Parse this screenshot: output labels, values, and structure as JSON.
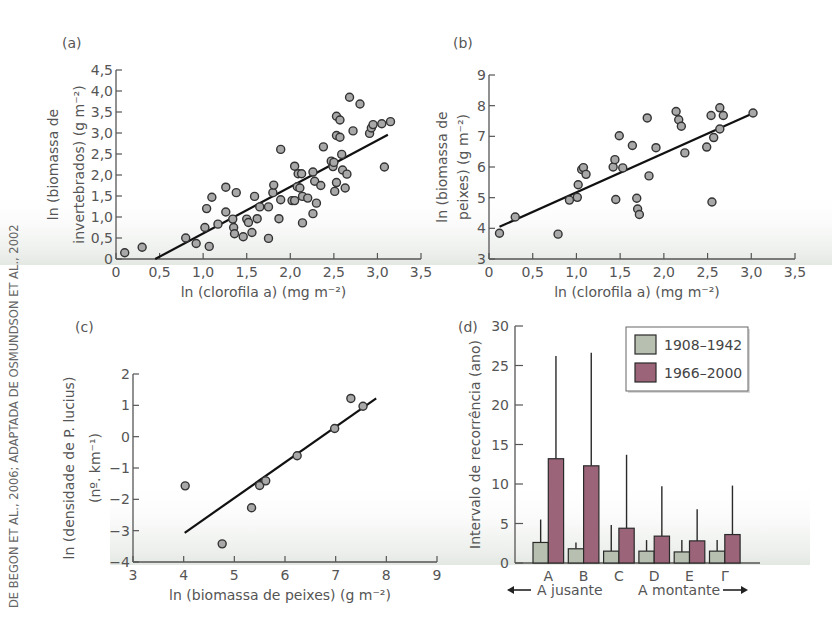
{
  "source_credit": "DE BEGON ET AL., 2006; ADAPTADA DE OSMUNDSON ET AL., 2002",
  "colors": {
    "axis": "#555555",
    "point_fill": "#a8a8a8",
    "point_stroke": "#333333",
    "fit_line": "#111111",
    "series_1908": "#b6bfb0",
    "series_1966": "#9b6479",
    "bar_stroke": "#2a2a2a",
    "bg_shade": "#e9ece8"
  },
  "chart_data": [
    {
      "panel": "(a)",
      "type": "scatter",
      "title": "",
      "xlabel": "ln (clorofila a) (mg m⁻²)",
      "ylabel_line1": "ln (biomassa de",
      "ylabel_line2": "invertebrados) (g m⁻²)",
      "xlim": [
        0,
        3.5
      ],
      "ylim": [
        0,
        4.5
      ],
      "xticks": [
        0,
        0.5,
        1.0,
        1.5,
        2.0,
        2.5,
        3.0,
        3.5
      ],
      "xtick_labels": [
        "0",
        "0,5",
        "1,0",
        "1,5",
        "2,0",
        "2,5",
        "3,0",
        "3,5"
      ],
      "yticks": [
        0,
        0.5,
        1.0,
        1.5,
        2.0,
        2.5,
        3.0,
        3.5,
        4.0,
        4.5
      ],
      "ytick_labels": [
        "0",
        "0,5",
        "1,0",
        "1,5",
        "2,0",
        "2,5",
        "3,0",
        "3,5",
        "4,0",
        "4,5"
      ],
      "fit_line": {
        "x": [
          0.45,
          3.12
        ],
        "y": [
          0.0,
          2.96
        ]
      },
      "points": [
        [
          0.1,
          0.15
        ],
        [
          0.3,
          0.28
        ],
        [
          0.8,
          0.5
        ],
        [
          0.92,
          0.37
        ],
        [
          1.02,
          0.75
        ],
        [
          1.04,
          1.2
        ],
        [
          1.07,
          0.3
        ],
        [
          1.1,
          1.47
        ],
        [
          1.17,
          0.83
        ],
        [
          1.26,
          1.12
        ],
        [
          1.26,
          1.71
        ],
        [
          1.34,
          0.95
        ],
        [
          1.35,
          0.75
        ],
        [
          1.36,
          0.6
        ],
        [
          1.38,
          1.58
        ],
        [
          1.46,
          0.53
        ],
        [
          1.5,
          0.95
        ],
        [
          1.52,
          0.87
        ],
        [
          1.56,
          0.63
        ],
        [
          1.59,
          1.49
        ],
        [
          1.62,
          0.96
        ],
        [
          1.65,
          1.24
        ],
        [
          1.75,
          1.24
        ],
        [
          1.75,
          0.49
        ],
        [
          1.8,
          1.58
        ],
        [
          1.81,
          1.76
        ],
        [
          1.87,
          0.96
        ],
        [
          1.89,
          2.61
        ],
        [
          1.89,
          1.41
        ],
        [
          2.02,
          1.39
        ],
        [
          2.05,
          1.39
        ],
        [
          2.05,
          2.21
        ],
        [
          2.08,
          1.72
        ],
        [
          2.09,
          2.03
        ],
        [
          2.11,
          1.69
        ],
        [
          2.13,
          2.03
        ],
        [
          2.14,
          0.86
        ],
        [
          2.14,
          1.49
        ],
        [
          2.2,
          1.45
        ],
        [
          2.26,
          2.07
        ],
        [
          2.26,
          1.08
        ],
        [
          2.28,
          1.85
        ],
        [
          2.3,
          1.33
        ],
        [
          2.35,
          1.75
        ],
        [
          2.38,
          2.67
        ],
        [
          2.47,
          2.33
        ],
        [
          2.49,
          2.2
        ],
        [
          2.5,
          2.3
        ],
        [
          2.51,
          1.61
        ],
        [
          2.53,
          1.82
        ],
        [
          2.53,
          2.94
        ],
        [
          2.53,
          3.4
        ],
        [
          2.57,
          3.31
        ],
        [
          2.57,
          2.9
        ],
        [
          2.59,
          2.49
        ],
        [
          2.6,
          2.12
        ],
        [
          2.63,
          1.69
        ],
        [
          2.65,
          2.02
        ],
        [
          2.68,
          3.85
        ],
        [
          2.72,
          3.05
        ],
        [
          2.8,
          3.69
        ],
        [
          2.91,
          2.99
        ],
        [
          2.93,
          3.12
        ],
        [
          2.95,
          3.2
        ],
        [
          3.05,
          3.22
        ],
        [
          3.08,
          2.19
        ],
        [
          3.15,
          3.27
        ]
      ]
    },
    {
      "panel": "(b)",
      "type": "scatter",
      "title": "",
      "xlabel": "ln (clorofila a) (mg m⁻²)",
      "ylabel_line1": "ln (biomassa de",
      "ylabel_line2": "peixes) (g m⁻²)",
      "xlim": [
        0,
        3.5
      ],
      "ylim": [
        3,
        9
      ],
      "xticks": [
        0,
        0.5,
        1.0,
        1.5,
        2.0,
        2.5,
        3.0,
        3.5
      ],
      "xtick_labels": [
        "0",
        "0,5",
        "1,0",
        "1,5",
        "2,0",
        "2,5",
        "3,0",
        "3,5"
      ],
      "yticks": [
        3,
        4,
        5,
        6,
        7,
        8,
        9
      ],
      "ytick_labels": [
        "3",
        "4",
        "5",
        "6",
        "7",
        "8",
        "9"
      ],
      "fit_line": {
        "x": [
          0.12,
          3.02
        ],
        "y": [
          4.05,
          7.75
        ]
      },
      "points": [
        [
          0.12,
          3.84
        ],
        [
          0.3,
          4.37
        ],
        [
          0.79,
          3.81
        ],
        [
          0.92,
          4.92
        ],
        [
          1.01,
          5.01
        ],
        [
          1.02,
          5.42
        ],
        [
          1.06,
          5.92
        ],
        [
          1.08,
          5.98
        ],
        [
          1.11,
          5.76
        ],
        [
          1.42,
          6.0
        ],
        [
          1.44,
          6.24
        ],
        [
          1.45,
          4.94
        ],
        [
          1.49,
          7.02
        ],
        [
          1.53,
          5.97
        ],
        [
          1.64,
          6.7
        ],
        [
          1.69,
          4.98
        ],
        [
          1.7,
          4.63
        ],
        [
          1.72,
          4.45
        ],
        [
          1.81,
          7.6
        ],
        [
          1.83,
          5.71
        ],
        [
          1.91,
          6.63
        ],
        [
          2.14,
          7.81
        ],
        [
          2.17,
          7.54
        ],
        [
          2.2,
          7.33
        ],
        [
          2.24,
          6.46
        ],
        [
          2.49,
          6.65
        ],
        [
          2.54,
          7.68
        ],
        [
          2.55,
          4.86
        ],
        [
          2.57,
          6.96
        ],
        [
          2.64,
          7.93
        ],
        [
          2.64,
          7.24
        ],
        [
          2.68,
          7.68
        ],
        [
          3.02,
          7.76
        ]
      ]
    },
    {
      "panel": "(c)",
      "type": "scatter",
      "title": "",
      "xlabel": "ln (biomassa de peixes) (g m⁻²)",
      "ylabel_line1": "ln (densidade de P. lucius)",
      "ylabel_line2": "(nº. km⁻¹)",
      "xlim": [
        3,
        9
      ],
      "ylim": [
        -4,
        2
      ],
      "xticks": [
        3,
        4,
        5,
        6,
        7,
        8,
        9
      ],
      "xtick_labels": [
        "3",
        "4",
        "5",
        "6",
        "7",
        "8",
        "9"
      ],
      "yticks": [
        -4,
        -3,
        -2,
        -1,
        0,
        1,
        2
      ],
      "ytick_labels": [
        "−4",
        "−3",
        "−2",
        "−1",
        "0",
        "1",
        "2"
      ],
      "fit_line": {
        "x": [
          4.02,
          7.8
        ],
        "y": [
          -3.07,
          1.22
        ]
      },
      "points": [
        [
          4.03,
          -1.57
        ],
        [
          4.76,
          -3.42
        ],
        [
          5.34,
          -2.27
        ],
        [
          5.5,
          -1.56
        ],
        [
          5.62,
          -1.41
        ],
        [
          6.24,
          -0.61
        ],
        [
          6.98,
          0.26
        ],
        [
          7.3,
          1.22
        ],
        [
          7.54,
          0.97
        ]
      ]
    },
    {
      "panel": "(d)",
      "type": "bar",
      "title": "",
      "xlabel": "",
      "ylabel": "Intervalo de recorrência (ano)",
      "ylim": [
        0,
        30
      ],
      "yticks": [
        0,
        5,
        10,
        15,
        20,
        25,
        30
      ],
      "ytick_labels": [
        "0",
        "5",
        "10",
        "15",
        "20",
        "25",
        "30"
      ],
      "categories": [
        "A",
        "B",
        "C",
        "D",
        "E",
        "Γ"
      ],
      "series": [
        {
          "name": "1908–1942",
          "values": [
            2.6,
            1.8,
            1.5,
            1.5,
            1.4,
            1.5
          ],
          "error_upper": [
            5.5,
            2.6,
            4.8,
            2.9,
            2.9,
            2.9
          ]
        },
        {
          "name": "1966–2000",
          "values": [
            13.2,
            12.3,
            4.4,
            3.4,
            2.8,
            3.6
          ],
          "error_upper": [
            26.2,
            26.6,
            13.7,
            9.7,
            6.8,
            9.8
          ]
        }
      ],
      "legend_position": "upper right",
      "direction_left": "A jusante",
      "direction_right": "A montante"
    }
  ]
}
